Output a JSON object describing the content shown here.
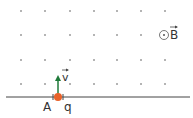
{
  "diagram": {
    "field_symbol": "⊙",
    "field_label": "B",
    "velocity_label": "v",
    "point_label": "A",
    "charge_label": "q",
    "colors": {
      "dots": "#555555",
      "line": "#444444",
      "particle": "#e8622a",
      "velocity_arrow": "#1f7a3a",
      "text": "#333333"
    },
    "grid": {
      "columns_x": [
        21,
        45,
        70,
        94,
        117,
        141
      ],
      "rows_y": [
        11,
        35,
        60,
        84
      ]
    }
  }
}
